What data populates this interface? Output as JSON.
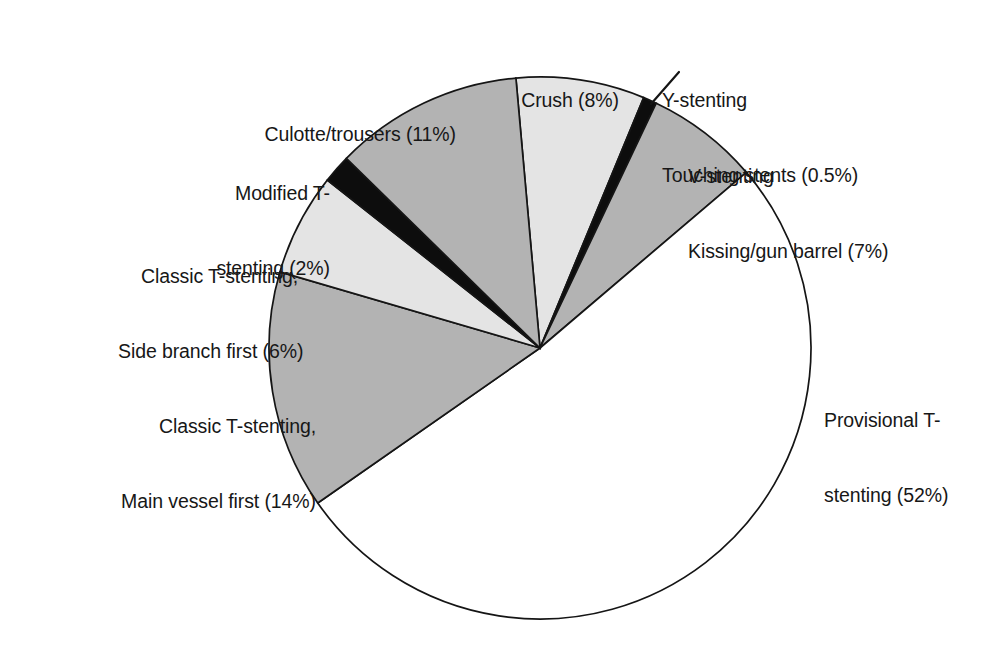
{
  "chart_data": {
    "type": "pie",
    "title": "",
    "subtitle": "",
    "xlabel": "",
    "ylabel": "",
    "legend_position": "none",
    "grid": false,
    "units": "percent",
    "start_angle_deg": 354.9,
    "direction": "clockwise",
    "center": {
      "x": 540,
      "y": 348
    },
    "radius": 271,
    "categories": [
      "Crush",
      "Y-stenting Touching stents",
      "V-stenting Kissing/gun barrel",
      "Provisional T-stenting",
      "Classic T-stenting, Main vessel first",
      "Classic T-stenting, Side branch first",
      "Modified T-stenting",
      "Culotte/trousers"
    ],
    "values": [
      8,
      0.5,
      7,
      52,
      14,
      6,
      2,
      11
    ],
    "value_labels": [
      "8%",
      "0.5%",
      "7%",
      "52%",
      "14%",
      "6%",
      "2%",
      "11%"
    ],
    "slice_colors": [
      "#e4e4e4",
      "#0d0d0d",
      "#b3b3b3",
      "#ffffff",
      "#b3b3b3",
      "#e4e4e4",
      "#0d0d0d",
      "#b3b3b3"
    ],
    "slice_angles_deg": [
      {
        "start": 354.9,
        "end": 382.5
      },
      {
        "start": 382.5,
        "end": 385.4
      },
      {
        "start": 385.4,
        "end": 409.6
      },
      {
        "start": 409.6,
        "end": 595.1
      },
      {
        "start": 595.1,
        "end": 646.3
      },
      {
        "start": 646.3,
        "end": 668.3
      },
      {
        "start": 668.3,
        "end": 674.4
      },
      {
        "start": 674.4,
        "end": 714.9
      }
    ]
  },
  "labels": {
    "culotte": {
      "line1": "Culotte/trousers (11%)"
    },
    "crush": {
      "line1": "Crush (8%)"
    },
    "ystenting": {
      "line1": "Y-stenting",
      "line2": "Touching stents (0.5%)"
    },
    "vstenting": {
      "line1": "V-stenting",
      "line2": "Kissing/gun barrel (7%)"
    },
    "modified_t": {
      "line1": "Modified T-",
      "line2": "stenting (2%)"
    },
    "classic_side": {
      "line1": "Classic T-stenting,",
      "line2": "Side branch first (6%)"
    },
    "classic_main": {
      "line1": "Classic T-stenting,",
      "line2": "Main vessel first (14%)"
    },
    "provisional": {
      "line1": "Provisional T-",
      "line2": "stenting (52%)"
    }
  },
  "colors": {
    "outline": "#151515",
    "light_gray": "#e4e4e4",
    "medium_gray": "#b3b3b3",
    "black": "#0d0d0d",
    "white": "#ffffff",
    "background": "#ffffff",
    "text": "#171717"
  }
}
